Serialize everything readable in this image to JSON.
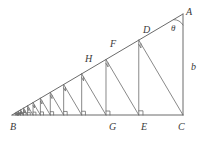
{
  "figure": {
    "kind": "geometry-diagram",
    "stroke_color": "#6b6b6b",
    "label_color": "#3a3a3a",
    "background_color": "#ffffff",
    "line_width": 0.8
  },
  "labels": {
    "A": "A",
    "B": "B",
    "C": "C",
    "D": "D",
    "E": "E",
    "F": "F",
    "G": "G",
    "H": "H",
    "theta": "θ",
    "b": "b"
  },
  "points": {
    "A": {
      "x": 183,
      "y": 14
    },
    "B": {
      "x": 12,
      "y": 115
    },
    "C": {
      "x": 183,
      "y": 115
    },
    "D": {
      "x": 145,
      "y": 37
    },
    "E": {
      "x": 145,
      "y": 115
    },
    "F": {
      "x": 113,
      "y": 51
    },
    "G": {
      "x": 113,
      "y": 115
    },
    "H": {
      "x": 87,
      "y": 66
    },
    "I": {
      "x": 87,
      "y": 115
    }
  },
  "label_positions": {
    "A": {
      "x": 186,
      "y": 7
    },
    "B": {
      "x": 10,
      "y": 122
    },
    "C": {
      "x": 178,
      "y": 122
    },
    "D": {
      "x": 143,
      "y": 25
    },
    "E": {
      "x": 141,
      "y": 122
    },
    "F": {
      "x": 110,
      "y": 39
    },
    "G": {
      "x": 109,
      "y": 122
    },
    "H": {
      "x": 85,
      "y": 54
    },
    "theta": {
      "x": 171,
      "y": 24
    },
    "b": {
      "x": 191,
      "y": 62
    }
  },
  "chart_data": {
    "type": "diagram",
    "title": "",
    "geometry": {
      "outer_triangle": [
        "B",
        "C",
        "A"
      ],
      "right_angle_at": "C",
      "angle_marked": {
        "vertex": "A",
        "label": "θ"
      },
      "side_marked": {
        "from": "A",
        "to": "C",
        "label": "b"
      },
      "cascade_rule": "From C drop a perpendicular to hypotenuse BA meeting at D; from D drop a vertical to base BC meeting at E; from E drop a perpendicular to BA meeting at F; from F drop a vertical to BC at G; continue indefinitely toward B",
      "named_feet_on_hypotenuse": [
        "D",
        "F",
        "H"
      ],
      "named_feet_on_base": [
        "E",
        "G"
      ],
      "right_angle_markers_on_hypotenuse": 12,
      "right_angle_markers_on_base": 12,
      "cascade_steps_drawn": 13,
      "converges_to": "B"
    }
  }
}
